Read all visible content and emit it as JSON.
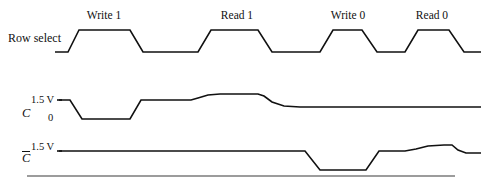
{
  "figure": {
    "type": "timing-diagram",
    "width": 482,
    "height": 191,
    "background": "#ffffff",
    "line_color": "#111111"
  },
  "rows": {
    "row_select": {
      "label": "Row select",
      "label_x": 8,
      "label_y": 32
    },
    "c": {
      "label": "C",
      "label_x": 22,
      "label_y": 107,
      "high_label": "1.5 V",
      "high_label_x": 31,
      "high_label_y": 95,
      "low_label": "0",
      "low_label_x": 48,
      "low_label_y": 113
    },
    "c_bar": {
      "label": "C",
      "overbar": true,
      "label_x": 22,
      "label_y": 151,
      "high_label": "1.5 V",
      "high_label_x": 31,
      "high_label_y": 142
    }
  },
  "phases": [
    {
      "label": "Write 1",
      "x": 104,
      "y": 10
    },
    {
      "label": "Read 1",
      "x": 237,
      "y": 10
    },
    {
      "label": "Write 0",
      "x": 348,
      "y": 10
    },
    {
      "label": "Read 0",
      "x": 432,
      "y": 10
    }
  ],
  "chart_data": {
    "type": "line",
    "title": "",
    "xlabel": "",
    "ylabel": "",
    "grid": false,
    "legend": "none",
    "series": [
      {
        "name": "Row select",
        "levels": {
          "low": 52,
          "high": 30
        },
        "points": [
          [
            55,
            52
          ],
          [
            68,
            52
          ],
          [
            79,
            30
          ],
          [
            130,
            30
          ],
          [
            143,
            52
          ],
          [
            198,
            52
          ],
          [
            211,
            30
          ],
          [
            258,
            30
          ],
          [
            272,
            52
          ],
          [
            320,
            52
          ],
          [
            333,
            30
          ],
          [
            362,
            30
          ],
          [
            377,
            52
          ],
          [
            405,
            52
          ],
          [
            418,
            30
          ],
          [
            449,
            30
          ],
          [
            464,
            52
          ],
          [
            481,
            52
          ]
        ]
      },
      {
        "name": "C",
        "levels": {
          "high": 100,
          "low": 119,
          "boost": 94
        },
        "points": [
          [
            59,
            100
          ],
          [
            70,
            100
          ],
          [
            82,
            119
          ],
          [
            130,
            119
          ],
          [
            141,
            100
          ],
          [
            191,
            100
          ],
          [
            198,
            98
          ],
          [
            208,
            95
          ],
          [
            220,
            94
          ],
          [
            258,
            94
          ],
          [
            264,
            96
          ],
          [
            272,
            102
          ],
          [
            284,
            106
          ],
          [
            300,
            107
          ],
          [
            481,
            107
          ]
        ]
      },
      {
        "name": "Cbar",
        "levels": {
          "high": 151,
          "low": 170,
          "boost": 145
        },
        "points": [
          [
            59,
            151
          ],
          [
            305,
            151
          ],
          [
            320,
            170
          ],
          [
            366,
            170
          ],
          [
            379,
            151
          ],
          [
            405,
            151
          ],
          [
            416,
            149
          ],
          [
            428,
            146
          ],
          [
            444,
            145
          ],
          [
            452,
            145
          ],
          [
            458,
            150
          ],
          [
            466,
            153
          ],
          [
            481,
            153
          ]
        ]
      }
    ],
    "rules": [
      {
        "name": "baseline-rule",
        "x1": 27,
        "y1": 176,
        "x2": 455,
        "y2": 176
      }
    ],
    "level_ticks": [
      {
        "name": "c-high-tick",
        "x1": 57,
        "y1": 100,
        "x2": 62,
        "y2": 100
      },
      {
        "name": "cbar-high-tick",
        "x1": 57,
        "y1": 151,
        "x2": 62,
        "y2": 151
      }
    ]
  }
}
